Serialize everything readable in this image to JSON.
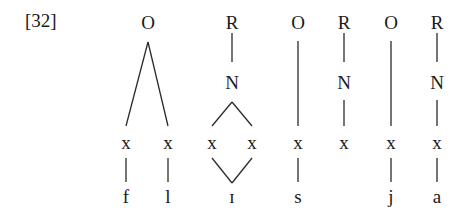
{
  "example_number": "[32]",
  "diagram": {
    "type": "syllable-structure tree",
    "constituents": [
      {
        "id": "O1",
        "label": "O",
        "x": 148
      },
      {
        "id": "R1",
        "label": "R",
        "x": 232,
        "nucleus": "N"
      },
      {
        "id": "O2",
        "label": "O",
        "x": 298
      },
      {
        "id": "R2",
        "label": "R",
        "x": 344,
        "nucleus": "N"
      },
      {
        "id": "O3",
        "label": "O",
        "x": 391
      },
      {
        "id": "R3",
        "label": "R",
        "x": 437,
        "nucleus": "N"
      }
    ],
    "skeleton": [
      {
        "label": "x",
        "x": 126,
        "segment": "f"
      },
      {
        "label": "x",
        "x": 168,
        "segment": "l"
      },
      {
        "label": "x",
        "x": 212,
        "segment": "ɪ"
      },
      {
        "label": "x",
        "x": 252,
        "segment": ""
      },
      {
        "label": "x",
        "x": 298,
        "segment": "s"
      },
      {
        "label": "x",
        "x": 344,
        "segment": ""
      },
      {
        "label": "x",
        "x": 391,
        "segment": "j"
      },
      {
        "label": "x",
        "x": 437,
        "segment": "a"
      }
    ],
    "segments": {
      "f": "f",
      "l": "l",
      "long_vowel": "ɪ",
      "s": "s",
      "j": "j",
      "a": "a"
    },
    "labels": {
      "O1": "O",
      "R1": "R",
      "N1": "N",
      "O2": "O",
      "R2": "R",
      "N2": "N",
      "O3": "O",
      "R3": "R",
      "N3": "N",
      "x": "x"
    }
  }
}
